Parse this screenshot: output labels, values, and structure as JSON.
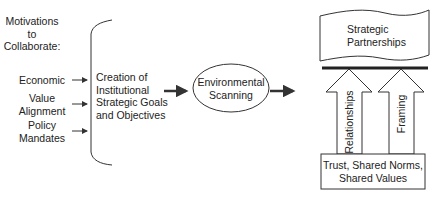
{
  "diagram": {
    "motivations_title": [
      "Motivations",
      "to",
      "Collaborate:"
    ],
    "motivations": [
      {
        "label_lines": [
          "Economic"
        ]
      },
      {
        "label_lines": [
          "Value",
          "Alignment"
        ]
      },
      {
        "label_lines": [
          "Policy",
          "Mandates"
        ]
      }
    ],
    "goals_box": [
      "Creation of",
      "Institutional",
      "Strategic Goals",
      "and Objectives"
    ],
    "scanning_node": [
      "Environmental",
      "Scanning"
    ],
    "partnerships_node": [
      "Strategic",
      "Partnerships"
    ],
    "pillars": [
      {
        "label": "Relationships"
      },
      {
        "label": "Framing"
      }
    ],
    "foundation_box": [
      "Trust, Shared Norms,",
      "Shared Values"
    ]
  },
  "colors": {
    "stroke": "#333333",
    "text": "#222222",
    "background": "#ffffff"
  }
}
